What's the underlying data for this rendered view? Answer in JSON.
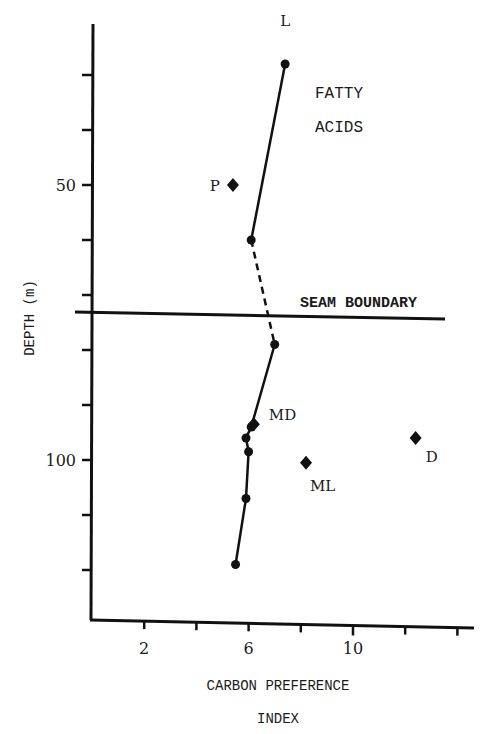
{
  "chart_data": {
    "type": "scatter",
    "title": "FATTY ACIDS",
    "title_lines": [
      "FATTY",
      "ACIDS"
    ],
    "xlabel": "CARBON PREFERENCE INDEX",
    "xlabel_lines": [
      "CARBON PREFERENCE",
      "INDEX"
    ],
    "ylabel": "DEPTH (m)",
    "xlim": [
      0,
      15
    ],
    "ylim": [
      142,
      20
    ],
    "y_inverted": true,
    "x_ticks": [
      2,
      4,
      6,
      8,
      10,
      12,
      14
    ],
    "x_tick_labels": [
      {
        "value": 2,
        "label": "2"
      },
      {
        "value": 6,
        "label": "6"
      },
      {
        "value": 10,
        "label": "10"
      }
    ],
    "y_ticks": [
      30,
      40,
      50,
      60,
      70,
      80,
      90,
      100,
      110,
      120
    ],
    "y_tick_labels": [
      {
        "value": 50,
        "label": "50"
      },
      {
        "value": 100,
        "label": "100"
      }
    ],
    "grid": false,
    "annotations": [
      {
        "text": "SEAM BOUNDARY",
        "type": "hline",
        "y": 74
      }
    ],
    "series": [
      {
        "name": "Upper seam profile",
        "marker": "circle",
        "line": "solid",
        "points": [
          {
            "x": 7.4,
            "y": 28,
            "label": "L"
          },
          {
            "x": 6.1,
            "y": 60
          }
        ]
      },
      {
        "name": "Seam boundary connection",
        "marker": "none",
        "line": "dashed",
        "points": [
          {
            "x": 6.1,
            "y": 60
          },
          {
            "x": 7.0,
            "y": 79
          }
        ]
      },
      {
        "name": "Lower seam profile",
        "marker": "circle",
        "line": "solid",
        "points": [
          {
            "x": 7.0,
            "y": 79
          },
          {
            "x": 6.1,
            "y": 94
          },
          {
            "x": 5.9,
            "y": 96
          },
          {
            "x": 6.0,
            "y": 98.5
          },
          {
            "x": 5.9,
            "y": 107
          },
          {
            "x": 5.5,
            "y": 119
          }
        ]
      },
      {
        "name": "Individual samples",
        "marker": "diamond",
        "line": "none",
        "points": [
          {
            "x": 5.4,
            "y": 50,
            "label": "P"
          },
          {
            "x": 6.2,
            "y": 93.5,
            "label": "MD"
          },
          {
            "x": 8.2,
            "y": 100.5,
            "label": "ML"
          },
          {
            "x": 12.4,
            "y": 96,
            "label": "D"
          }
        ]
      }
    ]
  }
}
